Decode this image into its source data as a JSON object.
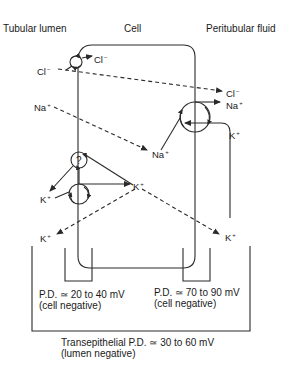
{
  "regions": {
    "lumen": "Tubular lumen",
    "cell": "Cell",
    "peritubular": "Peritubular fluid"
  },
  "ions": {
    "cl_lumen": {
      "base": "Cl",
      "charge": "−"
    },
    "cl_cell": {
      "base": "Cl",
      "charge": "−"
    },
    "cl_peri": {
      "base": "Cl",
      "charge": "−"
    },
    "na_lumen": {
      "base": "Na",
      "charge": "+"
    },
    "na_cell": {
      "base": "Na",
      "charge": "+"
    },
    "na_peri": {
      "base": "Na",
      "charge": "+"
    },
    "k_peri_top": {
      "base": "K",
      "charge": "+"
    },
    "k_cell": {
      "base": "K",
      "charge": "+"
    },
    "k_lumen_upper": {
      "base": "K",
      "charge": "+"
    },
    "k_lumen_lower": {
      "base": "K",
      "charge": "+"
    },
    "k_peri_bottom": {
      "base": "K",
      "charge": "+"
    }
  },
  "transporters": {
    "unknown_channel_symbol": "?"
  },
  "potentials": {
    "apical": {
      "line1": "P.D. ≃ 20 to 40 mV",
      "line2": "(cell negative)"
    },
    "basolateral": {
      "line1": "P.D. ≃ 70 to 90 mV",
      "line2": "(cell negative)"
    },
    "transepithelial": {
      "line1": "Transepithelial P.D. ≃ 30 to 60 mV",
      "line2": "(lumen negative)"
    }
  },
  "colors": {
    "line": "#2a2a2a",
    "background": "#ffffff"
  }
}
